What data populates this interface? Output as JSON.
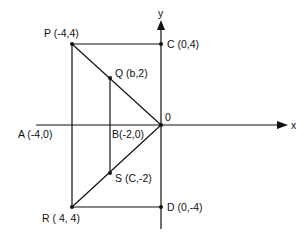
{
  "diagram": {
    "axes": {
      "x_label": "x",
      "y_label": "y",
      "origin_label": "0"
    },
    "points": {
      "P": "P (-4,4)",
      "C": "C (0,4)",
      "Q": "Q (b,2)",
      "A": "A (-4,0)",
      "B": "B(-2,0)",
      "S": "S (C,-2)",
      "R": "R ( 4, 4)",
      "D": "D (0,-4)"
    },
    "colors": {
      "line": "#111111",
      "background": "#ffffff"
    }
  }
}
